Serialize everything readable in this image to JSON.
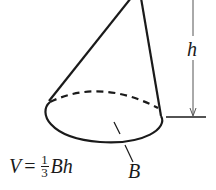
{
  "diagram": {
    "labels": {
      "height": "h",
      "base": "B"
    },
    "formula": {
      "lhs": "V",
      "equals": "=",
      "numerator": "1",
      "denominator": "3",
      "rhs": "Bh"
    },
    "colors": {
      "stroke": "#1a1a1a",
      "background": "#ffffff"
    }
  }
}
